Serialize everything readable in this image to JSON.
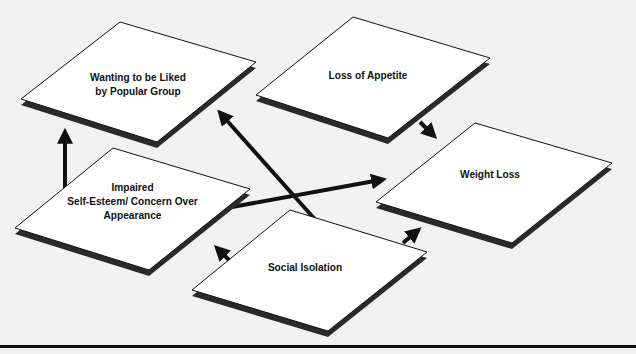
{
  "diagram": {
    "type": "flow-diagram",
    "background_color": "#f2f2f2",
    "node_fill": "#ffffff",
    "shadow_color": "#2a2a2a",
    "arrow_color": "#111111",
    "nodes": [
      {
        "id": "liked",
        "label_lines": [
          "Wanting to be Liked",
          "by Popular Group"
        ]
      },
      {
        "id": "appetite",
        "label_lines": [
          "Loss of Appetite"
        ]
      },
      {
        "id": "impaired",
        "label_lines": [
          "Impaired",
          "Self-Esteem/ Concern Over",
          "Appearance"
        ]
      },
      {
        "id": "weight",
        "label_lines": [
          "Weight Loss"
        ]
      },
      {
        "id": "social",
        "label_lines": [
          "Social Isolation"
        ]
      }
    ],
    "edges": [
      {
        "from": "impaired",
        "to": "liked"
      },
      {
        "from": "social",
        "to": "liked"
      },
      {
        "from": "impaired",
        "to": "weight"
      },
      {
        "from": "appetite",
        "to": "weight"
      },
      {
        "from": "social",
        "to": "impaired"
      },
      {
        "from": "social",
        "to": "weight"
      }
    ]
  }
}
